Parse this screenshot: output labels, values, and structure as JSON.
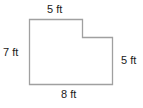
{
  "figure": {
    "type": "L-shaped polygon",
    "stroke_color": "#a0a0a0",
    "labels": {
      "top": "5 ft",
      "left": "7 ft",
      "right": "5 ft",
      "bottom": "8 ft"
    },
    "dimensions_ft": {
      "top": 5,
      "left": 7,
      "right": 5,
      "bottom": 8
    }
  }
}
